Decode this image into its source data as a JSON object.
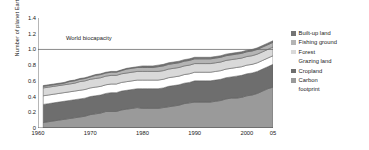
{
  "chart_data": {
    "type": "area",
    "stacked": true,
    "title": "",
    "subtitle": "",
    "xlabel": "",
    "ylabel": "Number of planet Earths",
    "xlim": [
      1960,
      2005
    ],
    "ylim": [
      0,
      1.4
    ],
    "grid": false,
    "legend_position": "right",
    "x_tick_labels": [
      "1960",
      "1970",
      "1980",
      "1990",
      "2000",
      "05"
    ],
    "x_tick_values": [
      1960,
      1970,
      1980,
      1990,
      2000,
      2005
    ],
    "y_tick_labels": [
      "0",
      "0.2",
      "0.4",
      "0.6",
      "0.8",
      "1.0",
      "1.2",
      "1.4"
    ],
    "y_tick_values": [
      0,
      0.2,
      0.4,
      0.6,
      0.8,
      1.0,
      1.2,
      1.4
    ],
    "annotations": [
      {
        "text": "World biocapacity",
        "y": 1.0,
        "type": "hline",
        "color": "#6b6b6b"
      }
    ],
    "x": [
      1961,
      1962,
      1963,
      1964,
      1965,
      1966,
      1967,
      1968,
      1969,
      1970,
      1971,
      1972,
      1973,
      1974,
      1975,
      1976,
      1977,
      1978,
      1979,
      1980,
      1981,
      1982,
      1983,
      1984,
      1985,
      1986,
      1987,
      1988,
      1989,
      1990,
      1991,
      1992,
      1993,
      1994,
      1995,
      1996,
      1997,
      1998,
      1999,
      2000,
      2001,
      2002,
      2003,
      2004,
      2005
    ],
    "series": [
      {
        "name": "Carbon footprint",
        "color": "#9a9a9a",
        "values": [
          0.07,
          0.08,
          0.09,
          0.1,
          0.11,
          0.12,
          0.13,
          0.14,
          0.15,
          0.17,
          0.18,
          0.19,
          0.21,
          0.21,
          0.21,
          0.23,
          0.24,
          0.25,
          0.26,
          0.25,
          0.25,
          0.25,
          0.25,
          0.26,
          0.27,
          0.28,
          0.29,
          0.31,
          0.32,
          0.33,
          0.33,
          0.33,
          0.33,
          0.34,
          0.35,
          0.37,
          0.38,
          0.38,
          0.39,
          0.41,
          0.42,
          0.44,
          0.47,
          0.5,
          0.52
        ]
      },
      {
        "name": "Cropland",
        "color": "#6e6e6e",
        "values": [
          0.23,
          0.23,
          0.23,
          0.23,
          0.23,
          0.23,
          0.23,
          0.23,
          0.23,
          0.23,
          0.23,
          0.23,
          0.23,
          0.24,
          0.24,
          0.24,
          0.24,
          0.24,
          0.24,
          0.25,
          0.25,
          0.25,
          0.25,
          0.25,
          0.26,
          0.26,
          0.26,
          0.26,
          0.26,
          0.27,
          0.27,
          0.27,
          0.27,
          0.27,
          0.27,
          0.27,
          0.27,
          0.28,
          0.28,
          0.28,
          0.28,
          0.28,
          0.28,
          0.28,
          0.29
        ]
      },
      {
        "name": "Grazing land",
        "color": "#ffffff",
        "values": [
          0.11,
          0.11,
          0.11,
          0.11,
          0.11,
          0.11,
          0.11,
          0.11,
          0.11,
          0.11,
          0.11,
          0.11,
          0.11,
          0.11,
          0.11,
          0.11,
          0.11,
          0.11,
          0.11,
          0.11,
          0.11,
          0.11,
          0.11,
          0.11,
          0.11,
          0.11,
          0.11,
          0.11,
          0.11,
          0.11,
          0.11,
          0.11,
          0.11,
          0.11,
          0.11,
          0.11,
          0.11,
          0.11,
          0.11,
          0.11,
          0.11,
          0.11,
          0.11,
          0.11,
          0.11
        ]
      },
      {
        "name": "Forest",
        "color": "#d9d9d9",
        "values": [
          0.1,
          0.1,
          0.1,
          0.1,
          0.1,
          0.1,
          0.1,
          0.11,
          0.11,
          0.11,
          0.11,
          0.11,
          0.11,
          0.11,
          0.11,
          0.11,
          0.11,
          0.11,
          0.11,
          0.11,
          0.11,
          0.11,
          0.11,
          0.11,
          0.11,
          0.11,
          0.11,
          0.11,
          0.11,
          0.11,
          0.11,
          0.11,
          0.11,
          0.11,
          0.11,
          0.11,
          0.11,
          0.11,
          0.11,
          0.11,
          0.11,
          0.11,
          0.11,
          0.11,
          0.11
        ]
      },
      {
        "name": "Fishing ground",
        "color": "#b4b4b4",
        "values": [
          0.02,
          0.02,
          0.02,
          0.02,
          0.02,
          0.03,
          0.03,
          0.03,
          0.03,
          0.03,
          0.04,
          0.04,
          0.04,
          0.04,
          0.04,
          0.04,
          0.05,
          0.05,
          0.05,
          0.05,
          0.05,
          0.05,
          0.06,
          0.06,
          0.06,
          0.06,
          0.06,
          0.06,
          0.06,
          0.06,
          0.06,
          0.06,
          0.06,
          0.06,
          0.06,
          0.06,
          0.06,
          0.06,
          0.06,
          0.06,
          0.06,
          0.06,
          0.06,
          0.06,
          0.06
        ]
      },
      {
        "name": "Built-up land",
        "color": "#747474",
        "values": [
          0.01,
          0.01,
          0.01,
          0.01,
          0.01,
          0.01,
          0.01,
          0.01,
          0.01,
          0.01,
          0.01,
          0.01,
          0.01,
          0.01,
          0.01,
          0.01,
          0.01,
          0.01,
          0.01,
          0.02,
          0.02,
          0.02,
          0.02,
          0.02,
          0.02,
          0.02,
          0.02,
          0.02,
          0.02,
          0.02,
          0.02,
          0.02,
          0.02,
          0.02,
          0.02,
          0.02,
          0.02,
          0.02,
          0.02,
          0.02,
          0.02,
          0.02,
          0.02,
          0.02,
          0.02
        ]
      }
    ],
    "legend": [
      {
        "label": "Built-up land",
        "color": "#747474",
        "has_swatch": true
      },
      {
        "label": "Fishing ground",
        "color": "#b4b4b4",
        "has_swatch": true
      },
      {
        "label": "Forest",
        "color": "#d9d9d9",
        "has_swatch": true
      },
      {
        "label": "Grazing land",
        "color": "#ffffff",
        "has_swatch": false
      },
      {
        "label": "Cropland",
        "color": "#6e6e6e",
        "has_swatch": true
      },
      {
        "label": "Carbon",
        "label2": "footprint",
        "color": "#9a9a9a",
        "has_swatch": true
      }
    ]
  },
  "axis": {
    "y_title": "Number of planet Earths",
    "y_ticks": [
      "1.4",
      "1.2",
      "1.0",
      "0.8",
      "0.6",
      "0.4",
      "0.2",
      "0"
    ],
    "x_ticks": [
      "1960",
      "1970",
      "1980",
      "1990",
      "2000",
      "05"
    ]
  },
  "annotation": {
    "biocapacity": "World biocapacity"
  },
  "legend": {
    "items": [
      {
        "label": "Built-up land"
      },
      {
        "label": "Fishing ground"
      },
      {
        "label": "Forest"
      },
      {
        "label": "Grazing land"
      },
      {
        "label": "Cropland"
      },
      {
        "label": "Carbon"
      },
      {
        "label": "footprint"
      }
    ]
  },
  "colors": {
    "built_up_land": "#747474",
    "fishing_ground": "#b4b4b4",
    "forest": "#d9d9d9",
    "grazing_land": "#ffffff",
    "cropland": "#6e6e6e",
    "carbon_footprint": "#9a9a9a",
    "axis": "#4a4a4a",
    "biocapacity_line": "#6b6b6b"
  }
}
